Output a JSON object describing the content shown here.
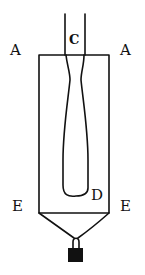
{
  "diagram": {
    "labels": {
      "top_left": "A",
      "top_right": "A",
      "tube": "C",
      "inner_bottom": "D",
      "bottom_left": "E",
      "bottom_right": "E"
    },
    "colors": {
      "ink": "#111111",
      "background": "#ffffff"
    }
  }
}
